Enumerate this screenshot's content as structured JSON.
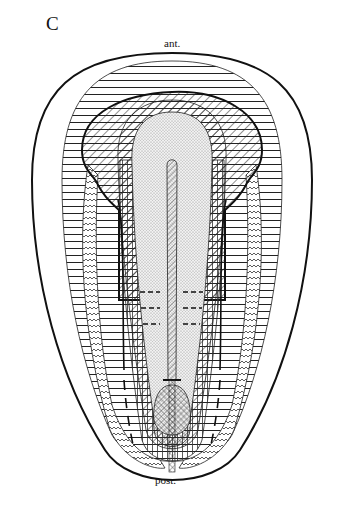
{
  "figure": {
    "panel_label": "C",
    "anterior_label": "ant.",
    "posterior_label": "post."
  },
  "patterns": {
    "outer_layer": "horizontal-lines",
    "wavy_band": "wavy-lines",
    "head_region": "diagonal-hatch",
    "core": "stipple-dots",
    "axial_rod": "diagonal-hatch",
    "posterior_lobe": "crosshatch",
    "inner_sheath": "vertical-lines"
  },
  "colors": {
    "ink": "#111111",
    "background": "#ffffff",
    "stipple": "#9a9a9a"
  }
}
